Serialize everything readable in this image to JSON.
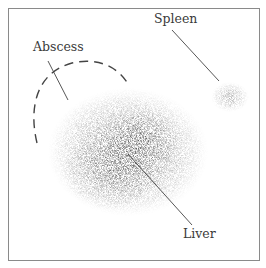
{
  "diagram": {
    "type": "scintigraphy-illustration",
    "labels": {
      "abscess": "Abscess",
      "spleen": "Spleen",
      "liver": "Liver"
    },
    "colors": {
      "border": "#8a8a8a",
      "leader_line": "#444444",
      "uptake": "#555555",
      "background": "#ffffff"
    }
  }
}
